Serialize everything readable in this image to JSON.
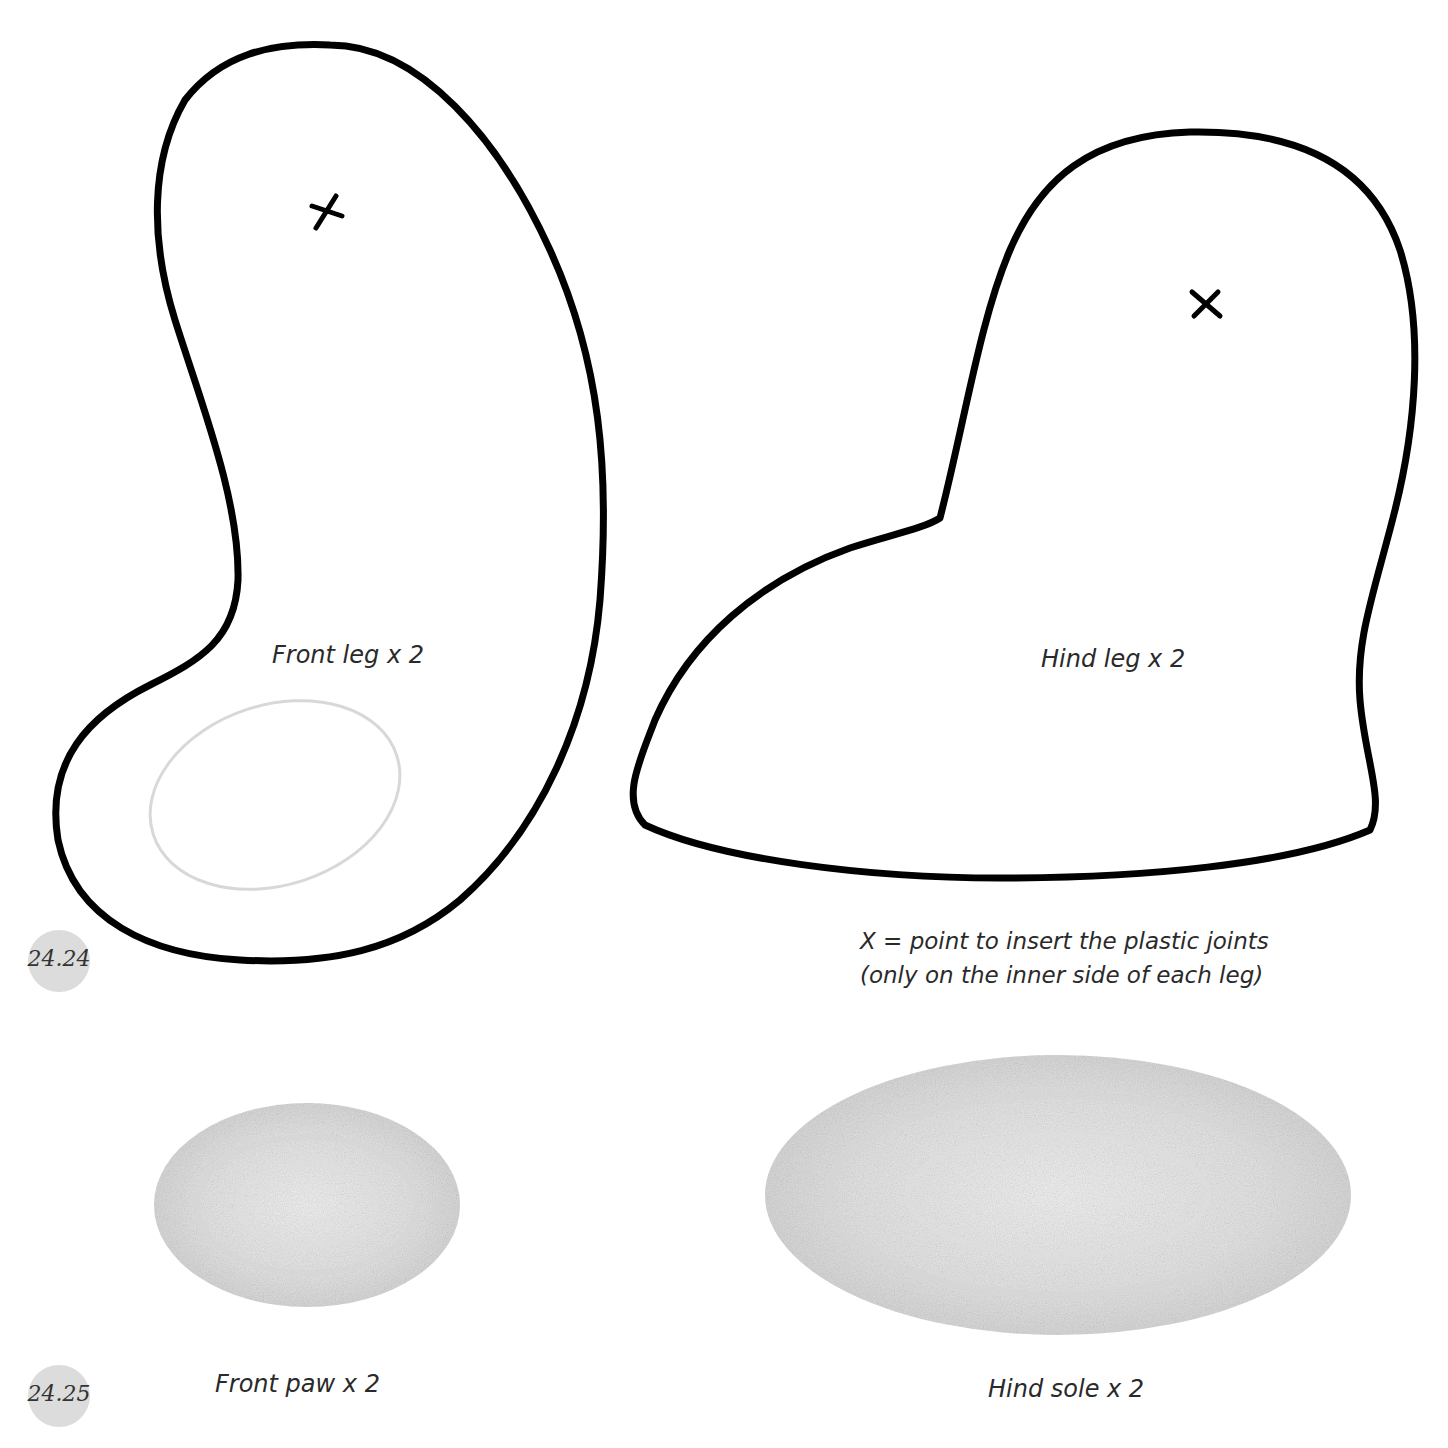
{
  "figures": [
    {
      "id_label": "24.24",
      "pieces": [
        {
          "name": "front-leg",
          "label": "Front leg x 2",
          "has_joint_mark": true
        },
        {
          "name": "hind-leg",
          "label": "Hind leg x 2",
          "has_joint_mark": true
        }
      ],
      "note": {
        "line1": "X = point to insert the plastic joints",
        "line2": "(only on the inner side of each leg)"
      }
    },
    {
      "id_label": "24.25",
      "pieces": [
        {
          "name": "front-paw",
          "label": "Front paw x 2"
        },
        {
          "name": "hind-sole",
          "label": "Hind sole x 2"
        }
      ]
    }
  ],
  "colors": {
    "outline": "#000000",
    "pencil_fill": "#d6d6d6",
    "badge": "#dcdcdc",
    "background": "#ffffff"
  }
}
